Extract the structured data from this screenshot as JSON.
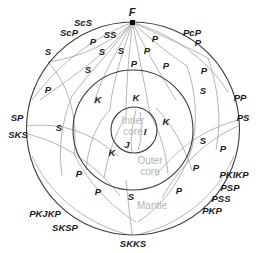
{
  "figure": {
    "type": "cross-section-ray-diagram",
    "colors": {
      "background": "#ffffff",
      "boundary_stroke": "#3c3c3c",
      "ray_stroke": "#a8a8a8",
      "label_text": "#1a1a1a",
      "layer_text": "#b3b3b3",
      "focus_marker": "#000000"
    }
  },
  "geometry": {
    "earth": {
      "cx": 133,
      "cy": 128.5,
      "r": 106.5
    },
    "outer_core": {
      "cx": 133,
      "cy": 130,
      "r": 60
    },
    "inner_core": {
      "cx": 134,
      "cy": 130,
      "r": 23
    },
    "focus": {
      "x": 132.5,
      "y": 22.5
    }
  },
  "layers": [
    {
      "name": "Inner core",
      "line1": "Inner",
      "line2": "core",
      "x": 133,
      "y": 126
    },
    {
      "name": "Outer core",
      "line1": "Outer",
      "line2": "core",
      "x": 150,
      "y": 166
    },
    {
      "name": "Mantle",
      "line1": "Mantle",
      "line2": "",
      "x": 152,
      "y": 206
    }
  ],
  "focus_label": {
    "text": "F",
    "x": 132,
    "y": 12
  },
  "exterior_labels": [
    {
      "text": "ScS",
      "x": 83,
      "y": 23
    },
    {
      "text": "ScP",
      "x": 69,
      "y": 33
    },
    {
      "text": "SS",
      "x": 110,
      "y": 35
    },
    {
      "text": "PcP",
      "x": 192,
      "y": 33
    },
    {
      "text": "PP",
      "x": 240,
      "y": 98
    },
    {
      "text": "PS",
      "x": 243,
      "y": 118
    },
    {
      "text": "SP",
      "x": 17,
      "y": 118
    },
    {
      "text": "SKS",
      "x": 18,
      "y": 135
    },
    {
      "text": "PKIKP",
      "x": 234,
      "y": 175
    },
    {
      "text": "PSP",
      "x": 230,
      "y": 188
    },
    {
      "text": "PSS",
      "x": 221,
      "y": 199
    },
    {
      "text": "PKP",
      "x": 212,
      "y": 211
    },
    {
      "text": "PKJKP",
      "x": 45,
      "y": 214
    },
    {
      "text": "SKSP",
      "x": 65,
      "y": 228
    },
    {
      "text": "SKKS",
      "x": 133,
      "y": 244
    }
  ],
  "phase_labels": [
    {
      "text": "S",
      "x": 48,
      "y": 52
    },
    {
      "text": "P",
      "x": 93,
      "y": 42
    },
    {
      "text": "S",
      "x": 102,
      "y": 52
    },
    {
      "text": "S",
      "x": 121,
      "y": 51
    },
    {
      "text": "P",
      "x": 147,
      "y": 51
    },
    {
      "text": "P",
      "x": 155,
      "y": 39
    },
    {
      "text": "P",
      "x": 198,
      "y": 43
    },
    {
      "text": "P",
      "x": 134,
      "y": 64
    },
    {
      "text": "P",
      "x": 166,
      "y": 66
    },
    {
      "text": "S",
      "x": 88,
      "y": 70
    },
    {
      "text": "P",
      "x": 204,
      "y": 71
    },
    {
      "text": "S",
      "x": 203,
      "y": 91
    },
    {
      "text": "P",
      "x": 48,
      "y": 90
    },
    {
      "text": "K",
      "x": 98,
      "y": 100
    },
    {
      "text": "K",
      "x": 136,
      "y": 98
    },
    {
      "text": "K",
      "x": 166,
      "y": 122
    },
    {
      "text": "I",
      "x": 145,
      "y": 132
    },
    {
      "text": "J",
      "x": 127,
      "y": 145
    },
    {
      "text": "K",
      "x": 112,
      "y": 153
    },
    {
      "text": "S",
      "x": 59,
      "y": 128
    },
    {
      "text": "S",
      "x": 203,
      "y": 141
    },
    {
      "text": "P",
      "x": 223,
      "y": 149
    },
    {
      "text": "P",
      "x": 196,
      "y": 168
    },
    {
      "text": "P",
      "x": 79,
      "y": 174
    },
    {
      "text": "P",
      "x": 98,
      "y": 192
    },
    {
      "text": "S",
      "x": 131,
      "y": 197
    },
    {
      "text": "P",
      "x": 179,
      "y": 191
    }
  ],
  "rays": [
    {
      "name": "P-direct-left",
      "d": "M132.5,22.5 C100,60 70,78 40,100"
    },
    {
      "name": "S-shallow-left",
      "d": "M132.5,22.5 C105,48 75,58 48,62"
    },
    {
      "name": "ScP-left",
      "d": "M132.5,22.5 C110,52 90,72 72,96"
    },
    {
      "name": "SS-bounce-left",
      "d": "M132.5,22.5 C112,60 100,80 94,104"
    },
    {
      "name": "P-core-left",
      "d": "M132.5,22.5 C120,60 112,86 110,110"
    },
    {
      "name": "P-core-center",
      "d": "M132.5,22.5 C128,62 126,92 126,116"
    },
    {
      "name": "P-core-right",
      "d": "M132.5,22.5 C140,62 146,92 150,114"
    },
    {
      "name": "P-mid-right",
      "d": "M132.5,22.5 C150,58 164,80 176,100"
    },
    {
      "name": "PcP-right",
      "d": "M132.5,22.5 C156,44 172,56 187,66"
    },
    {
      "name": "P-shallow-right",
      "d": "M132.5,22.5 C162,36 186,46 208,58"
    },
    {
      "name": "surface-arc-upper-left",
      "d": "M32,100 C60,62 96,36 132.5,22.5"
    },
    {
      "name": "surface-arc-upper-right",
      "d": "M132.5,22.5 C172,34 206,58 228,92"
    },
    {
      "name": "mantle-arc-left-1",
      "d": "M48,62 C70,86 78,120 74,154"
    },
    {
      "name": "mantle-arc-left-2",
      "d": "M72,96 C62,120 58,148 62,176"
    },
    {
      "name": "mantle-arc-left-3",
      "d": "M27,126 C60,122 92,132 118,156"
    },
    {
      "name": "mantle-arc-left-4",
      "d": "M27,134 C62,142 96,164 120,196"
    },
    {
      "name": "mantle-arc-right-1",
      "d": "M187,66 C196,92 198,120 192,148"
    },
    {
      "name": "mantle-arc-right-2",
      "d": "M208,58 C218,88 222,118 216,150"
    },
    {
      "name": "mantle-arc-right-3",
      "d": "M238,120 C208,128 178,146 156,176"
    },
    {
      "name": "mantle-arc-right-4",
      "d": "M238,126 C206,140 180,166 162,198"
    },
    {
      "name": "core-path-left-1",
      "d": "M110,110 C96,124 88,146 86,170"
    },
    {
      "name": "core-path-left-2",
      "d": "M126,116 C116,132 108,154 104,178"
    },
    {
      "name": "core-path-right-1",
      "d": "M150,114 C160,132 166,152 168,174"
    },
    {
      "name": "core-path-right-2",
      "d": "M156,108 C172,124 184,146 192,170"
    },
    {
      "name": "inner-core-path-I",
      "d": "M140,112 C142,124 142,138 138,150"
    },
    {
      "name": "inner-core-path-J",
      "d": "M136,110 C132,126 130,140 132,152"
    },
    {
      "name": "deep-path-lower-left",
      "d": "M74,154 C88,182 110,206 136,222"
    },
    {
      "name": "deep-path-lower-right",
      "d": "M192,148 C182,180 162,206 138,222"
    },
    {
      "name": "surface-arc-lower-left",
      "d": "M32,156 C48,192 82,222 126,234"
    },
    {
      "name": "surface-arc-lower-right",
      "d": "M234,156 C218,194 182,224 140,234"
    },
    {
      "name": "bottom-ray-center",
      "d": "M126,180 C128,200 130,218 132,234"
    }
  ]
}
